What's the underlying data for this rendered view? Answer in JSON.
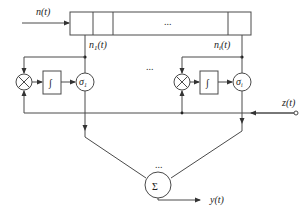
{
  "diagram": {
    "input_label": "n(t)",
    "delay_line": {
      "cells": 4,
      "ellipsis": "..."
    },
    "branches": [
      {
        "tap_label": "n",
        "tap_sub": "1",
        "tap_suffix": "(t)",
        "multiplier_symbol": "⊗",
        "integrator_symbol": "∫",
        "gain_label": "σ",
        "gain_sub": "1"
      },
      {
        "tap_label": "n",
        "tap_sub": "i",
        "tap_suffix": "(t)",
        "multiplier_symbol": "⊗",
        "integrator_symbol": "∫",
        "gain_label": "σ",
        "gain_sub": "i"
      }
    ],
    "between_branches_ellipsis": "...",
    "reference_label": "z(t)",
    "summer_symbol": "Σ",
    "summer_ellipsis": "...",
    "output_label": "y(t)",
    "colors": {
      "line": "#4a4a4a",
      "text": "#222222",
      "background": "#ffffff"
    }
  }
}
